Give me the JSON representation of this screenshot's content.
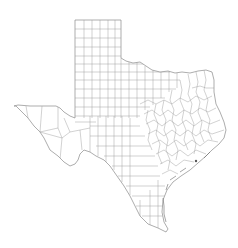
{
  "map": {
    "subject": "Texas county boundaries",
    "background_color": "#ffffff",
    "outline_color": "#8a8a8a",
    "county_line_color": "#9a9a9a",
    "marker_color": "#555555"
  }
}
